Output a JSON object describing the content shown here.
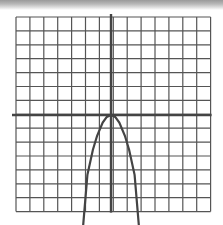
{
  "chart_data": {
    "type": "line",
    "title": "",
    "xlabel": "",
    "ylabel": "",
    "grid": true,
    "grid_columns": 14,
    "grid_rows": 14,
    "xlim": [
      -7,
      7
    ],
    "ylim": [
      -7,
      7
    ],
    "axis_origin_px": [
      111,
      115
    ],
    "cell_px": 13.9,
    "series": [
      {
        "name": "downward parabola",
        "description": "Concave-down parabola with vertex at the origin, extending below the grid",
        "x": [
          -2.0,
          -1.7,
          -1.3,
          -1.0,
          -0.6,
          -0.3,
          0,
          0.3,
          0.6,
          1.0,
          1.3,
          1.7,
          2.0
        ],
        "y": [
          -7.9,
          -4.3,
          -2.5,
          -1.5,
          -0.55,
          -0.14,
          0,
          -0.14,
          -0.55,
          -1.5,
          -2.5,
          -4.3,
          -7.9
        ]
      }
    ],
    "colors": {
      "grid": "#555555",
      "axes": "#444444",
      "curve": "#444444"
    }
  }
}
